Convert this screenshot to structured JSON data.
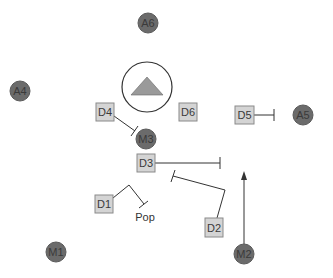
{
  "colors": {
    "circle_fill": "#6b6b6b",
    "circle_stroke": "#5a5a5a",
    "box_fill": "#d4d4d4",
    "box_stroke": "#8a8a8a",
    "line": "#333333",
    "triangle_fill": "#9a9a9a"
  },
  "circle_nodes": [
    {
      "id": "A6",
      "label": "A6",
      "cx": 148,
      "cy": 23
    },
    {
      "id": "A4",
      "label": "A4",
      "cx": 20,
      "cy": 91
    },
    {
      "id": "A5",
      "label": "A5",
      "cx": 303,
      "cy": 115
    },
    {
      "id": "M3",
      "label": "M3",
      "cx": 146,
      "cy": 139
    },
    {
      "id": "M1",
      "label": "M1",
      "cx": 56,
      "cy": 252
    },
    {
      "id": "M2",
      "label": "M2",
      "cx": 244,
      "cy": 254
    }
  ],
  "box_nodes": [
    {
      "id": "D4",
      "label": "D4",
      "cx": 105,
      "cy": 112
    },
    {
      "id": "D6",
      "label": "D6",
      "cx": 188,
      "cy": 112
    },
    {
      "id": "D5",
      "label": "D5",
      "cx": 244,
      "cy": 115
    },
    {
      "id": "D3",
      "label": "D3",
      "cx": 146,
      "cy": 163
    },
    {
      "id": "D1",
      "label": "D1",
      "cx": 104,
      "cy": 204
    },
    {
      "id": "D2",
      "label": "D2",
      "cx": 214,
      "cy": 227
    }
  ],
  "center_symbol": {
    "shape": "triangle-in-circle",
    "cx": 147,
    "cy": 87
  },
  "labels": {
    "pop": "Pop",
    "a6": "A6",
    "a4": "A4",
    "a5": "A5",
    "m1": "M1",
    "m2": "M2",
    "m3": "M3",
    "d1": "D1",
    "d2": "D2",
    "d3": "D3",
    "d4": "D4",
    "d5": "D5",
    "d6": "D6"
  },
  "edges": [
    {
      "from": "D4",
      "to": "M3",
      "type": "inhibition"
    },
    {
      "from": "D5",
      "to": "A5",
      "type": "inhibition"
    },
    {
      "from": "D3",
      "to": "right",
      "type": "inhibition"
    },
    {
      "from": "D2",
      "to": "D3-region",
      "type": "inhibition"
    },
    {
      "from": "D1",
      "to": "Pop",
      "type": "inhibition"
    },
    {
      "from": "M2",
      "to": "up",
      "type": "activation"
    }
  ]
}
